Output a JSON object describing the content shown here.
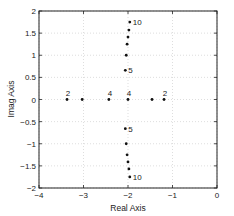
{
  "chart_data": {
    "type": "scatter",
    "title": "",
    "xlabel": "Real Axis",
    "ylabel": "Imag Axis",
    "xlim": [
      -4,
      0
    ],
    "ylim": [
      -2,
      2
    ],
    "grid": true,
    "x_ticks": [
      -4,
      -3,
      -2,
      -1,
      0
    ],
    "x_tick_labels": [
      "−4",
      "−3",
      "−2",
      "−1",
      "0"
    ],
    "y_ticks": [
      2,
      1.5,
      1,
      0.5,
      0,
      -0.5,
      -1,
      -1.5,
      -2
    ],
    "y_tick_labels": [
      "2",
      "1.5",
      "1",
      "0.5",
      "0",
      "−0.5",
      "−1",
      "−1.5",
      "−2"
    ],
    "series": [
      {
        "name": "upper-branch",
        "points": [
          {
            "x": -2.06,
            "y": 0.66,
            "label": "5"
          },
          {
            "x": -2.04,
            "y": 1.0
          },
          {
            "x": -2.02,
            "y": 1.25
          },
          {
            "x": -2.0,
            "y": 1.41
          },
          {
            "x": -1.98,
            "y": 1.57
          },
          {
            "x": -1.96,
            "y": 1.75,
            "label": "10"
          }
        ]
      },
      {
        "name": "lower-branch",
        "points": [
          {
            "x": -2.06,
            "y": -0.66,
            "label": "5"
          },
          {
            "x": -2.04,
            "y": -1.0
          },
          {
            "x": -2.02,
            "y": -1.25
          },
          {
            "x": -2.0,
            "y": -1.41
          },
          {
            "x": -1.98,
            "y": -1.57
          },
          {
            "x": -1.96,
            "y": -1.75,
            "label": "10"
          }
        ]
      },
      {
        "name": "real-axis",
        "points": [
          {
            "x": -3.37,
            "y": 0,
            "label": "2"
          },
          {
            "x": -3.03,
            "y": 0
          },
          {
            "x": -2.43,
            "y": 0,
            "label": "4"
          },
          {
            "x": -2.0,
            "y": 0,
            "label": "4"
          },
          {
            "x": -1.46,
            "y": 0
          },
          {
            "x": -1.19,
            "y": 0,
            "label": "2"
          }
        ]
      }
    ]
  }
}
